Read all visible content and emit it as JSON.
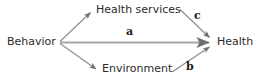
{
  "diagram": {
    "type": "path-diagram",
    "background_color": "#ffffff",
    "line_color": "#8a8a8a",
    "text_color": "#2b2b2b",
    "nodes": [
      {
        "id": "behavior",
        "label": "Behavior"
      },
      {
        "id": "health_services",
        "label": "Health services"
      },
      {
        "id": "environment",
        "label": "Environment"
      },
      {
        "id": "health",
        "label": "Health"
      }
    ],
    "path_labels": [
      {
        "id": "a",
        "label": "a"
      },
      {
        "id": "b",
        "label": "b"
      },
      {
        "id": "c",
        "label": "c"
      }
    ],
    "edges": [
      {
        "from": "behavior",
        "to": "health_services",
        "label": ""
      },
      {
        "from": "behavior",
        "to": "health",
        "label": "a"
      },
      {
        "from": "behavior",
        "to": "environment",
        "label": ""
      },
      {
        "from": "health_services",
        "to": "health",
        "label": "c"
      },
      {
        "from": "environment",
        "to": "health",
        "label": "b"
      }
    ]
  }
}
